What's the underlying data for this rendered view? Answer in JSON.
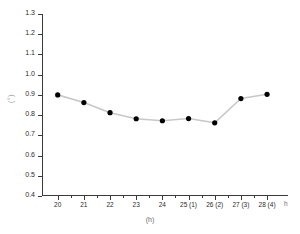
{
  "chart_data": {
    "type": "line",
    "title": "",
    "subtitle": "",
    "xlabel": "(h)",
    "ylabel": "(°)",
    "x_unit_suffix": "h",
    "grid": false,
    "legend": "none",
    "marker": "filled-circle",
    "line_color": "#c8c8c8",
    "marker_color": "#000000",
    "axis_color": "#3a3a3a",
    "background": "#ffffff",
    "xlim": [
      19.4,
      28.8
    ],
    "ylim": [
      0.4,
      1.3
    ],
    "ytick_values": [
      0.4,
      0.5,
      0.6,
      0.7,
      0.8,
      0.9,
      1.0,
      1.1,
      1.2,
      1.3
    ],
    "ytick_labels": [
      "0.4",
      "0.5",
      "0.6",
      "0.7",
      "0.8",
      "0.9",
      "1.0",
      "1.1",
      "1.2",
      "1.3"
    ],
    "xtick_values": [
      20,
      21,
      22,
      23,
      24,
      25,
      26,
      27,
      28
    ],
    "xtick_labels": [
      "20",
      "21",
      "22",
      "23",
      "24",
      "25 (1)",
      "26 (2)",
      "27 (3)",
      "28 (4)"
    ],
    "x": [
      20,
      21,
      22,
      23,
      24,
      25,
      26,
      27,
      28
    ],
    "values": [
      0.9,
      0.862,
      0.812,
      0.782,
      0.772,
      0.783,
      0.762,
      0.882,
      0.903
    ]
  }
}
